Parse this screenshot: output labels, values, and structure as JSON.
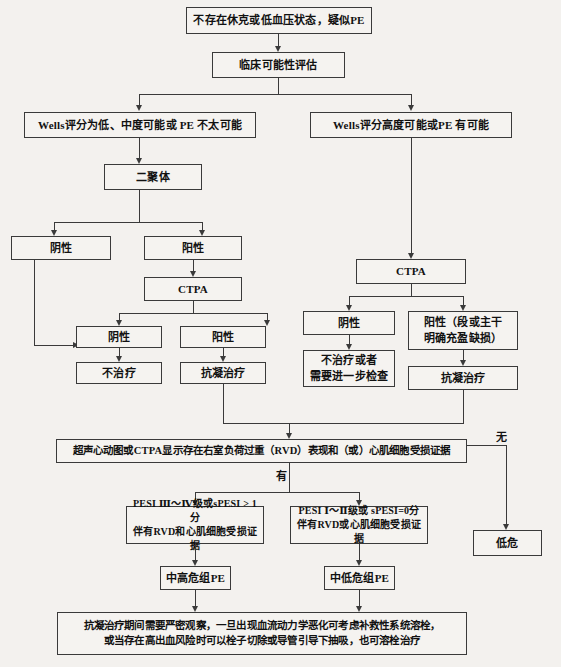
{
  "diagram": {
    "nodes": {
      "suspect_pe": "不存在休克或低血压状态，疑似PE",
      "clinical_probability": "临床可能性评估",
      "wells_low": "Wells评分为低、中度可能或 PE 不太可能",
      "wells_high": "Wells评分高度可能或PE 有可能",
      "d_dimer": "二聚体",
      "dd_negative": "阴性",
      "dd_positive": "阳性",
      "ctpa_left": "CTPA",
      "ctpa_left_negative": "阴性",
      "ctpa_left_positive": "阳性",
      "no_treatment": "不治疗",
      "anticoagulation_left": "抗凝治疗",
      "ctpa_right": "CTPA",
      "ctpa_right_negative": "阴性",
      "ctpa_right_positive": "阳性（段或主干\n明确充盈缺损）",
      "no_treatment_or_further": "不治疗或者\n需要进一步检查",
      "anticoagulation_right": "抗凝治疗",
      "rvd_assessment": "超声心动图或CTPA显示存在右室负荷过重（RVD）表现和（或）心肌细胞受损证据",
      "low_risk": "低危",
      "pesi_high": "PESI Ⅲ～Ⅳ级或sPESI > 1分\n伴有RVD和心肌细胞受损证据",
      "pesi_low": "PESI Ⅰ～Ⅱ级或 sPESI=0分\n伴有RVD或心肌细胞受损证据",
      "intermediate_high_pe": "中高危组PE",
      "intermediate_low_pe": "中低危组PE",
      "management": "抗凝治疗期间需要严密观察，一旦出现血流动力学恶化可考虑补救性系统溶栓，\n或当存在高出血风险时可以栓子切除或导管引导下抽吸，也可溶栓治疗"
    },
    "edge_labels": {
      "has_rvd": "有",
      "no_rvd": "无"
    },
    "colors": {
      "background": "#f3f1ee",
      "box_fill": "#f5f3f0",
      "line": "#3a3a3a",
      "text": "#111111"
    }
  }
}
